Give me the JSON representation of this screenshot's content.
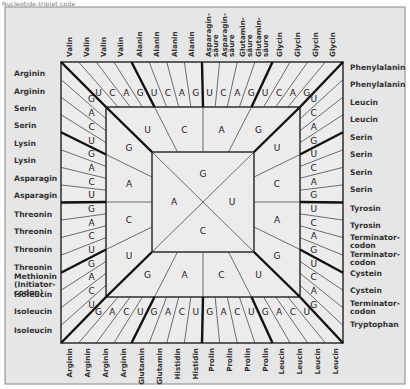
{
  "caption": "Nucleotide-triplet code",
  "center": {
    "top": "G",
    "right": "U",
    "bottom": "C",
    "left": "A"
  },
  "ring2": {
    "top": [
      "U",
      "C",
      "A",
      "G"
    ],
    "right": [
      "U",
      "C",
      "A",
      "G"
    ],
    "bottom": [
      "G",
      "A",
      "C",
      "U"
    ],
    "left": [
      "G",
      "A",
      "C",
      "U"
    ]
  },
  "ring3": {
    "top": [
      "U",
      "C",
      "A",
      "G",
      "U",
      "C",
      "A",
      "G",
      "U",
      "C",
      "A",
      "G",
      "U",
      "C",
      "A",
      "G"
    ],
    "right": [
      "U",
      "C",
      "A",
      "G",
      "U",
      "C",
      "A",
      "G",
      "U",
      "C",
      "A",
      "G",
      "U",
      "C",
      "A",
      "G"
    ],
    "bottom": [
      "G",
      "A",
      "C",
      "U",
      "G",
      "A",
      "C",
      "U",
      "G",
      "A",
      "C",
      "U",
      "G",
      "A",
      "C",
      "U"
    ],
    "left": [
      "G",
      "A",
      "C",
      "U",
      "G",
      "A",
      "C",
      "U",
      "G",
      "A",
      "C",
      "U",
      "G",
      "A",
      "C",
      "U"
    ]
  },
  "amino_acids": {
    "top": [
      [
        "Valin"
      ],
      [
        "Valin"
      ],
      [
        "Valin"
      ],
      [
        "Valin"
      ],
      [
        "Alanin"
      ],
      [
        "Alanin"
      ],
      [
        "Alanin"
      ],
      [
        "Alanin"
      ],
      [
        "Asparagin-",
        "säure"
      ],
      [
        "Asparagin-",
        "säure"
      ],
      [
        "Glutamin-",
        "säure"
      ],
      [
        "Glutamin-",
        "säure"
      ],
      [
        "Glycin"
      ],
      [
        "Glycin"
      ],
      [
        "Glycin"
      ],
      [
        "Glycin"
      ]
    ],
    "right": [
      [
        "Phenylalanin"
      ],
      [
        "Phenylalanin"
      ],
      [
        "Leucin"
      ],
      [
        "Leucin"
      ],
      [
        "Serin"
      ],
      [
        "Serin"
      ],
      [
        "Serin"
      ],
      [
        "Serin"
      ],
      [
        "Tyrosin"
      ],
      [
        "Tyrosin"
      ],
      [
        "Terminator-",
        "codon"
      ],
      [
        "Terminator-",
        "codon"
      ],
      [
        "Cystein"
      ],
      [
        "Cystein"
      ],
      [
        "Terminator-",
        "codon"
      ],
      [
        "Tryptophan"
      ]
    ],
    "bottom": [
      [
        "Arginin"
      ],
      [
        "Arginin"
      ],
      [
        "Arginin"
      ],
      [
        "Arginin"
      ],
      [
        "Glutamin"
      ],
      [
        "Glutamin"
      ],
      [
        "Histidin"
      ],
      [
        "Histidin"
      ],
      [
        "Prolin"
      ],
      [
        "Prolin"
      ],
      [
        "Prolin"
      ],
      [
        "Prolin"
      ],
      [
        "Leucin"
      ],
      [
        "Leucin"
      ],
      [
        "Leucin"
      ],
      [
        "Leucin"
      ]
    ],
    "left": [
      [
        "Arginin"
      ],
      [
        "Arginin"
      ],
      [
        "Serin"
      ],
      [
        "Serin"
      ],
      [
        "Lysin"
      ],
      [
        "Lysin"
      ],
      [
        "Asparagin"
      ],
      [
        "Asparagin"
      ],
      [
        "Threonin"
      ],
      [
        "Threonin"
      ],
      [
        "Threonin"
      ],
      [
        "Threonin"
      ],
      [
        "Methionin",
        "(Initiator-",
        "codon)"
      ],
      [
        "Isoleucin"
      ],
      [
        "Isoleucin"
      ],
      [
        "Isoleucin"
      ]
    ]
  },
  "colors": {
    "background": "#e6e6e6",
    "line": "#222222",
    "text": "#333333"
  }
}
